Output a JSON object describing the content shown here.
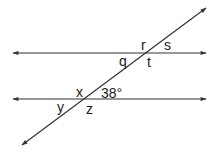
{
  "diagram": {
    "type": "parallel-lines-transversal",
    "stroke_color": "#333333",
    "lines": {
      "upper": {
        "y": 53,
        "x1": 13,
        "x2": 206
      },
      "lower": {
        "y": 99,
        "x1": 13,
        "x2": 206
      },
      "transversal": {
        "x1": 22,
        "y1": 145,
        "x2": 206,
        "y2": 8
      }
    },
    "labels": {
      "r": "r",
      "s": "s",
      "q": "q",
      "t": "t",
      "x": "x",
      "given_angle": "38°",
      "y": "y",
      "z": "z"
    }
  }
}
